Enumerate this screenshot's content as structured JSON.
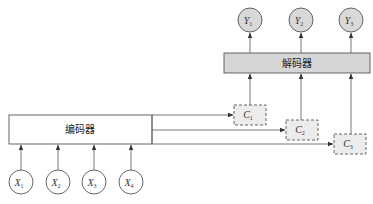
{
  "diagram": {
    "type": "encoder-decoder-attention",
    "encoder": {
      "label": "编码器"
    },
    "decoder": {
      "label": "解码器"
    },
    "inputs": [
      {
        "var": "X",
        "sub": "1"
      },
      {
        "var": "X",
        "sub": "2"
      },
      {
        "var": "X",
        "sub": "3"
      },
      {
        "var": "X",
        "sub": "4"
      }
    ],
    "contexts": [
      {
        "var": "C",
        "sub": "1"
      },
      {
        "var": "C",
        "sub": "2"
      },
      {
        "var": "C",
        "sub": "3"
      }
    ],
    "outputs": [
      {
        "var": "Y",
        "sub": "1"
      },
      {
        "var": "Y",
        "sub": "2"
      },
      {
        "var": "Y",
        "sub": "3"
      }
    ],
    "colors": {
      "stroke": "#444444",
      "decoder_fill": "#d6d6d6",
      "output_fill": "#d9d9d9",
      "context_fill": "#ececec",
      "encoder_fill": "#ffffff"
    }
  }
}
